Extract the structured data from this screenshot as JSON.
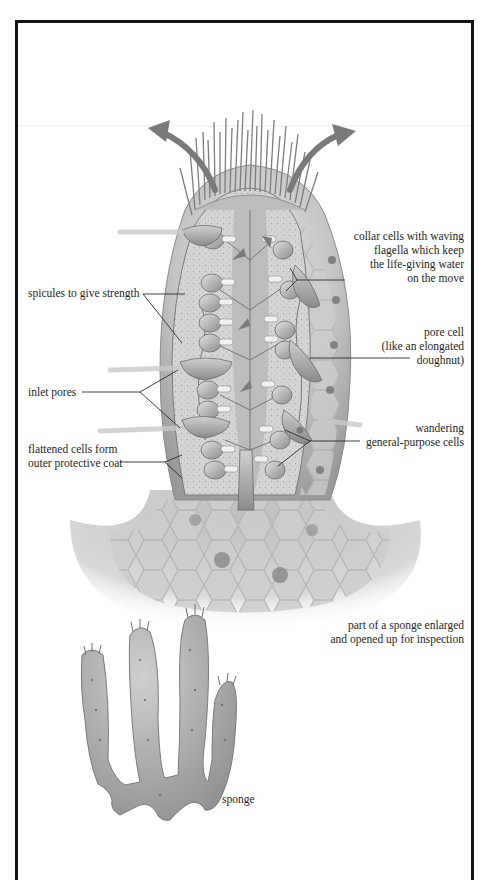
{
  "figure": {
    "colors": {
      "frame": "#141414",
      "body_light": "#d8d8d8",
      "body_mid": "#a9a9a9",
      "body_dark": "#6f6f6f",
      "arrow": "#7a7a7a",
      "leader": "#2a2a2a"
    }
  },
  "labels": {
    "collar_cells": {
      "lines": [
        "collar cells with waving",
        "flagella which keep",
        "the life-giving water",
        "on the move"
      ]
    },
    "spicules": {
      "lines": [
        "spicules to give strength"
      ]
    },
    "pore_cell": {
      "lines": [
        "pore cell",
        "(like an elongated",
        "doughnut)"
      ]
    },
    "inlet_pores": {
      "lines": [
        "inlet pores"
      ]
    },
    "wandering_cells": {
      "lines": [
        "wandering",
        "general-purpose cells"
      ]
    },
    "flattened_cells": {
      "lines": [
        "flattened cells form",
        "outer protective coat"
      ]
    },
    "enlarged_caption": {
      "lines": [
        "part of a sponge enlarged",
        "and opened up for inspection"
      ]
    },
    "sponge_caption": {
      "lines": [
        "sponge"
      ]
    }
  }
}
